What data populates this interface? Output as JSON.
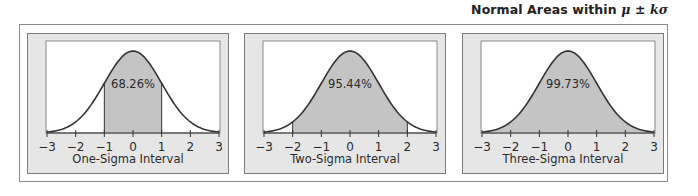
{
  "figure": {
    "title_text": "Normal Areas within ",
    "title_math": "μ ± kσ"
  },
  "colors": {
    "panel_bg": "#e6e6e6",
    "plot_bg": "#ffffff",
    "shade": "#c4c4c4",
    "curve": "#333333",
    "axis": "#333333"
  },
  "panels": [
    {
      "caption": "One-Sigma Interval",
      "label": "68.26%",
      "k": 1
    },
    {
      "caption": "Two-Sigma Interval",
      "label": "95.44%",
      "k": 2
    },
    {
      "caption": "Three-Sigma Interval",
      "label": "99.73%",
      "k": 3
    }
  ],
  "chart_data": [
    {
      "type": "area",
      "title": "One-Sigma Interval",
      "subtitle": "Normal Areas within μ ± kσ",
      "xlabel": "One-Sigma Interval",
      "ylabel": "",
      "x_ticks": [
        -3,
        -2,
        -1,
        0,
        1,
        2,
        3
      ],
      "xlim": [
        -3,
        3
      ],
      "curve": "standard normal density",
      "shaded_range": [
        -1,
        1
      ],
      "annotation": "68.26%",
      "grid": false
    },
    {
      "type": "area",
      "title": "Two-Sigma Interval",
      "subtitle": "Normal Areas within μ ± kσ",
      "xlabel": "Two-Sigma Interval",
      "ylabel": "",
      "x_ticks": [
        -3,
        -2,
        -1,
        0,
        1,
        2,
        3
      ],
      "xlim": [
        -3,
        3
      ],
      "curve": "standard normal density",
      "shaded_range": [
        -2,
        2
      ],
      "annotation": "95.44%",
      "grid": false
    },
    {
      "type": "area",
      "title": "Three-Sigma Interval",
      "subtitle": "Normal Areas within μ ± kσ",
      "xlabel": "Three-Sigma Interval",
      "ylabel": "",
      "x_ticks": [
        -3,
        -2,
        -1,
        0,
        1,
        2,
        3
      ],
      "xlim": [
        -3,
        3
      ],
      "curve": "standard normal density",
      "shaded_range": [
        -3,
        3
      ],
      "annotation": "99.73%",
      "grid": false
    }
  ],
  "tick_labels": [
    "−3",
    "−2",
    "−1",
    "0",
    "1",
    "2",
    "3"
  ]
}
